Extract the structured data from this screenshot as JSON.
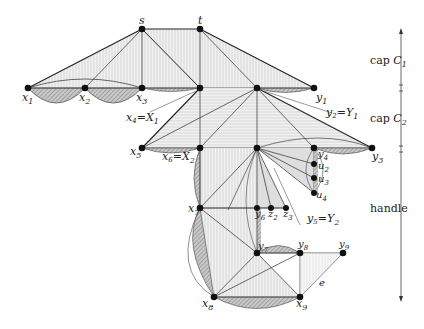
{
  "diagram": {
    "nodes": [
      {
        "id": "s",
        "label": "s",
        "x": 142,
        "y": 29
      },
      {
        "id": "t",
        "label": "t",
        "x": 200,
        "y": 29
      },
      {
        "id": "x1",
        "label": "x1",
        "x": 28,
        "y": 88
      },
      {
        "id": "x2",
        "label": "x2",
        "x": 85,
        "y": 88
      },
      {
        "id": "x3",
        "label": "x3",
        "x": 142,
        "y": 88
      },
      {
        "id": "x4",
        "label": "x4=X1",
        "x": 200,
        "y": 88
      },
      {
        "id": "top_mid",
        "label": "",
        "x": 257,
        "y": 88
      },
      {
        "id": "y1",
        "label": "y1",
        "x": 314,
        "y": 88
      },
      {
        "id": "x5",
        "label": "x5",
        "x": 142,
        "y": 148
      },
      {
        "id": "x6",
        "label": "x6=X2",
        "x": 200,
        "y": 148
      },
      {
        "id": "y5",
        "label": "y5=Y2",
        "x": 257,
        "y": 148
      },
      {
        "id": "y4",
        "label": "y4",
        "x": 314,
        "y": 148
      },
      {
        "id": "y3",
        "label": "y3",
        "x": 372,
        "y": 148
      },
      {
        "id": "u2",
        "label": "u2",
        "x": 314,
        "y": 164
      },
      {
        "id": "u3",
        "label": "u3",
        "x": 314,
        "y": 178
      },
      {
        "id": "u4",
        "label": "u4",
        "x": 314,
        "y": 193
      },
      {
        "id": "x7",
        "label": "x7",
        "x": 200,
        "y": 208
      },
      {
        "id": "y6",
        "label": "y6",
        "x": 257,
        "y": 208
      },
      {
        "id": "z2",
        "label": "z2",
        "x": 271,
        "y": 208
      },
      {
        "id": "z3",
        "label": "z3",
        "x": 286,
        "y": 208
      },
      {
        "id": "y7",
        "label": "y7",
        "x": 257,
        "y": 253
      },
      {
        "id": "y8",
        "label": "y8",
        "x": 300,
        "y": 253
      },
      {
        "id": "y9",
        "label": "y9",
        "x": 343,
        "y": 253
      },
      {
        "id": "x8",
        "label": "x8",
        "x": 214,
        "y": 297
      },
      {
        "id": "x9",
        "label": "x9",
        "x": 300,
        "y": 297
      }
    ],
    "annotations": {
      "y2_label": "y2=Y1",
      "edge_label": "e"
    },
    "sections": [
      {
        "label": "cap C1",
        "y_start": 30,
        "y_end": 88
      },
      {
        "label": "cap C2",
        "y_start": 88,
        "y_end": 150
      },
      {
        "label": "handle",
        "y_start": 150,
        "y_end": 300
      }
    ]
  },
  "labels": {
    "s": "s",
    "t": "t",
    "x1": "x",
    "x1_sub": "1",
    "x2": "x",
    "x2_sub": "2",
    "x3": "x",
    "x3_sub": "3",
    "x4": "x",
    "x4_sub": "4",
    "X1": "=X",
    "X1_sub": "1",
    "y1": "y",
    "y1_sub": "1",
    "y2": "y",
    "y2_sub": "2",
    "Y1": "=Y",
    "Y1_sub": "1",
    "x5": "x",
    "x5_sub": "5",
    "x6": "x",
    "x6_sub": "6",
    "X2": "=X",
    "X2_sub": "2",
    "y3": "y",
    "y3_sub": "3",
    "y4": "y",
    "y4_sub": "4",
    "u2": "u",
    "u2_sub": "2",
    "u3": "u",
    "u3_sub": "3",
    "u4": "u",
    "u4_sub": "4",
    "x7": "x",
    "x7_sub": "7",
    "y6": "y",
    "y6_sub": "6",
    "z2": "z",
    "z2_sub": "2",
    "z3": "z",
    "z3_sub": "3",
    "y5": "y",
    "y5_sub": "5",
    "Y2": "=Y",
    "Y2_sub": "2",
    "y7": "y",
    "y7_sub": "7",
    "y8": "y",
    "y8_sub": "8",
    "y9": "y",
    "y9_sub": "9",
    "x8": "x",
    "x8_sub": "8",
    "x9": "x",
    "x9_sub": "9",
    "e": "e",
    "cap": "cap ",
    "C1": "C",
    "C1_sub": "1",
    "C2": "C",
    "C2_sub": "2",
    "handle": "handle"
  },
  "colors": {
    "edge": "#333333",
    "node": "#111111",
    "fill_light": "#e6e6e6",
    "hatch": "#9a9a9a"
  }
}
